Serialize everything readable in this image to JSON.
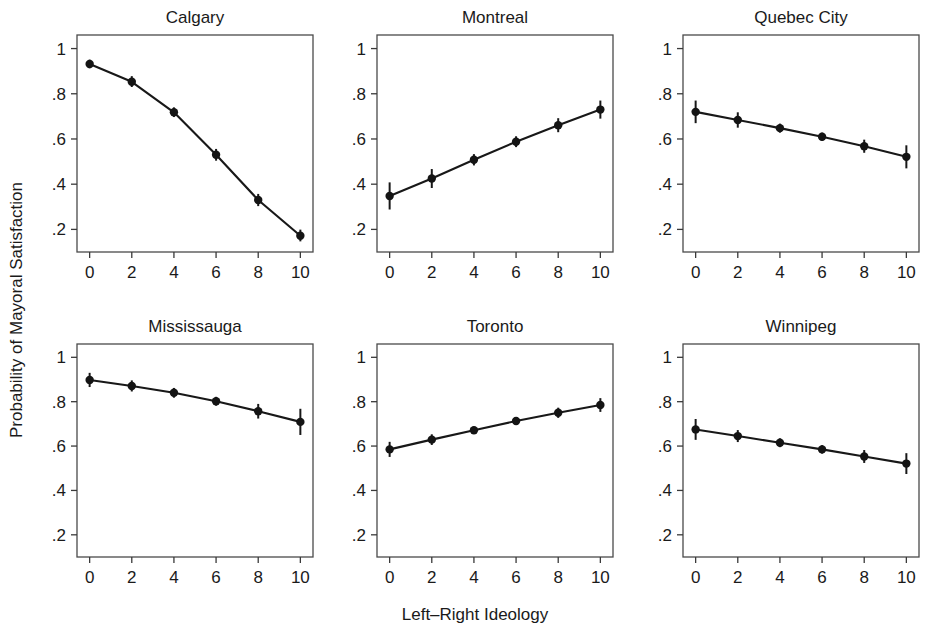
{
  "figure": {
    "xlabel": "Left–Right Ideology",
    "ylabel": "Probability of Mayoral Satisfaction"
  },
  "chart_data": {
    "type": "line",
    "title": "",
    "subtitle": "",
    "xlabel": "Left–Right Ideology",
    "ylabel": "Probability of Mayoral Satisfaction",
    "layout": {
      "rows": 2,
      "cols": 3,
      "grid": false,
      "legend": "none",
      "shared_x": true,
      "shared_y": true,
      "error_bars": "95% confidence interval"
    },
    "x": [
      0,
      2,
      4,
      6,
      8,
      10
    ],
    "xlim": [
      -0.6,
      10.6
    ],
    "ylim": [
      0.1,
      1.06
    ],
    "xticks": [
      0,
      2,
      4,
      6,
      8,
      10
    ],
    "xticklabels": [
      "0",
      "2",
      "4",
      "6",
      "8",
      "10"
    ],
    "yticks": [
      0.2,
      0.4,
      0.6,
      0.8,
      1.0
    ],
    "yticklabels": [
      ".2",
      ".4",
      ".6",
      ".8",
      "1"
    ],
    "panels": [
      {
        "title": "Calgary",
        "row": 0,
        "col": 0,
        "values": [
          0.932,
          0.853,
          0.718,
          0.53,
          0.33,
          0.172
        ],
        "err_low": [
          0.913,
          0.83,
          0.697,
          0.504,
          0.303,
          0.147
        ],
        "err_high": [
          0.951,
          0.878,
          0.74,
          0.556,
          0.357,
          0.199
        ]
      },
      {
        "title": "Montreal",
        "row": 0,
        "col": 1,
        "values": [
          0.348,
          0.425,
          0.508,
          0.588,
          0.661,
          0.73
        ],
        "err_low": [
          0.288,
          0.383,
          0.483,
          0.564,
          0.63,
          0.69
        ],
        "err_high": [
          0.408,
          0.467,
          0.533,
          0.612,
          0.692,
          0.77
        ]
      },
      {
        "title": "Quebec City",
        "row": 0,
        "col": 2,
        "values": [
          0.72,
          0.684,
          0.648,
          0.61,
          0.568,
          0.521
        ],
        "err_low": [
          0.67,
          0.65,
          0.628,
          0.592,
          0.539,
          0.47
        ],
        "err_high": [
          0.77,
          0.718,
          0.668,
          0.628,
          0.597,
          0.572
        ]
      },
      {
        "title": "Mississauga",
        "row": 1,
        "col": 0,
        "values": [
          0.898,
          0.871,
          0.84,
          0.802,
          0.757,
          0.709
        ],
        "err_low": [
          0.866,
          0.846,
          0.818,
          0.782,
          0.724,
          0.65
        ],
        "err_high": [
          0.93,
          0.896,
          0.862,
          0.822,
          0.79,
          0.768
        ]
      },
      {
        "title": "Toronto",
        "row": 1,
        "col": 1,
        "values": [
          0.585,
          0.629,
          0.671,
          0.713,
          0.75,
          0.785
        ],
        "err_low": [
          0.551,
          0.605,
          0.655,
          0.697,
          0.727,
          0.754
        ],
        "err_high": [
          0.619,
          0.653,
          0.687,
          0.729,
          0.773,
          0.816
        ]
      },
      {
        "title": "Winnipeg",
        "row": 1,
        "col": 2,
        "values": [
          0.675,
          0.645,
          0.615,
          0.585,
          0.553,
          0.521
        ],
        "err_low": [
          0.628,
          0.618,
          0.595,
          0.566,
          0.524,
          0.474
        ],
        "err_high": [
          0.722,
          0.672,
          0.635,
          0.604,
          0.582,
          0.568
        ]
      }
    ]
  }
}
